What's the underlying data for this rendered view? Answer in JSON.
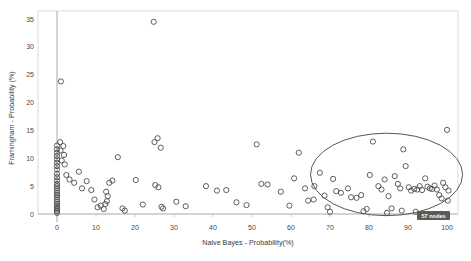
{
  "chart_data": {
    "type": "scatter",
    "title": "",
    "xlabel": "Naive Bayes - Probability(%)",
    "ylabel": "Framingham - Probability (%)",
    "xlim": [
      -4,
      106
    ],
    "ylim": [
      -1.2,
      37
    ],
    "xticks": [
      0,
      10,
      20,
      30,
      40,
      50,
      60,
      70,
      80,
      90,
      100
    ],
    "xtick_labels": [
      "0",
      "10",
      "20",
      "30",
      "40",
      "50",
      "60",
      "70",
      "80",
      "90",
      "100"
    ],
    "yticks": [
      0,
      5,
      10,
      15,
      20,
      25,
      30,
      35
    ],
    "ytick_labels": [
      "0",
      "5",
      "10",
      "15",
      "20",
      "25",
      "30",
      "35"
    ],
    "grid": false,
    "marker": "open-circle",
    "marker_color": "#4d4d4d",
    "marker_radius": 2.6,
    "points": [
      [
        0,
        0.2
      ],
      [
        0,
        0.5
      ],
      [
        0,
        0.8
      ],
      [
        0,
        1.1
      ],
      [
        0,
        1.4
      ],
      [
        0,
        1.8
      ],
      [
        0,
        2.2
      ],
      [
        0,
        2.6
      ],
      [
        0,
        3.0
      ],
      [
        0,
        3.4
      ],
      [
        0,
        3.8
      ],
      [
        0,
        4.2
      ],
      [
        0,
        4.6
      ],
      [
        0,
        5.0
      ],
      [
        0,
        5.4
      ],
      [
        0,
        6.0
      ],
      [
        0,
        6.6
      ],
      [
        0,
        7.2
      ],
      [
        0,
        8.0
      ],
      [
        0,
        8.6
      ],
      [
        0,
        9.2
      ],
      [
        0,
        9.8
      ],
      [
        0,
        10.4
      ],
      [
        0,
        11.0
      ],
      [
        0,
        11.6
      ],
      [
        0,
        12.3
      ],
      [
        0.8,
        12.9
      ],
      [
        1.6,
        12.2
      ],
      [
        0.9,
        11.4
      ],
      [
        1.8,
        10.6
      ],
      [
        1.2,
        9.6
      ],
      [
        2.0,
        8.9
      ],
      [
        1.0,
        23.8
      ],
      [
        2.4,
        7.0
      ],
      [
        3.2,
        6.2
      ],
      [
        4.4,
        5.6
      ],
      [
        5.6,
        7.6
      ],
      [
        6.4,
        4.6
      ],
      [
        7.6,
        5.9
      ],
      [
        8.8,
        4.3
      ],
      [
        9.6,
        2.6
      ],
      [
        10.4,
        1.2
      ],
      [
        11.2,
        1.5
      ],
      [
        12.0,
        0.9
      ],
      [
        12.4,
        1.8
      ],
      [
        12.8,
        2.3
      ],
      [
        13.0,
        3.2
      ],
      [
        12.6,
        4.0
      ],
      [
        13.4,
        5.6
      ],
      [
        14.2,
        6.0
      ],
      [
        15.6,
        10.2
      ],
      [
        16.8,
        1.0
      ],
      [
        17.4,
        0.6
      ],
      [
        20.2,
        6.1
      ],
      [
        22.0,
        1.7
      ],
      [
        24.8,
        34.5
      ],
      [
        25.0,
        12.9
      ],
      [
        25.8,
        13.6
      ],
      [
        26.6,
        11.9
      ],
      [
        25.2,
        5.2
      ],
      [
        26.0,
        4.8
      ],
      [
        26.8,
        1.3
      ],
      [
        27.2,
        1.0
      ],
      [
        30.6,
        2.2
      ],
      [
        33.0,
        1.4
      ],
      [
        38.2,
        5.0
      ],
      [
        41.0,
        4.2
      ],
      [
        43.4,
        4.3
      ],
      [
        46.0,
        2.1
      ],
      [
        48.6,
        1.6
      ],
      [
        51.2,
        12.5
      ],
      [
        52.4,
        5.4
      ],
      [
        54.0,
        5.3
      ],
      [
        57.4,
        4.0
      ],
      [
        59.6,
        1.5
      ],
      [
        62.0,
        11.0
      ],
      [
        63.6,
        4.6
      ],
      [
        64.4,
        2.4
      ],
      [
        65.8,
        2.6
      ],
      [
        67.4,
        7.4
      ],
      [
        68.6,
        3.3
      ],
      [
        69.4,
        1.2
      ],
      [
        70.8,
        6.3
      ],
      [
        71.6,
        4.1
      ],
      [
        72.8,
        3.8
      ],
      [
        74.6,
        4.6
      ],
      [
        75.4,
        3.0
      ],
      [
        76.8,
        2.9
      ],
      [
        78.0,
        3.4
      ],
      [
        79.4,
        0.9
      ],
      [
        80.2,
        7.0
      ],
      [
        81.0,
        13.0
      ],
      [
        82.4,
        5.0
      ],
      [
        83.2,
        4.4
      ],
      [
        84.0,
        6.2
      ],
      [
        85.0,
        3.2
      ],
      [
        85.8,
        1.0
      ],
      [
        86.6,
        6.8
      ],
      [
        87.4,
        5.4
      ],
      [
        88.0,
        4.6
      ],
      [
        88.8,
        11.6
      ],
      [
        89.4,
        8.6
      ],
      [
        90.2,
        4.8
      ],
      [
        90.8,
        4.2
      ],
      [
        91.6,
        4.5
      ],
      [
        92.4,
        4.4
      ],
      [
        93.0,
        5.0
      ],
      [
        93.6,
        4.3
      ],
      [
        94.4,
        6.4
      ],
      [
        95.0,
        4.9
      ],
      [
        95.6,
        4.6
      ],
      [
        96.2,
        4.5
      ],
      [
        96.8,
        5.1
      ],
      [
        97.4,
        4.4
      ],
      [
        98.0,
        3.4
      ],
      [
        98.6,
        2.8
      ],
      [
        99.0,
        5.6
      ],
      [
        99.6,
        4.8
      ],
      [
        100.0,
        15.1
      ],
      [
        100.4,
        4.2
      ],
      [
        100.2,
        2.4
      ],
      [
        88.4,
        0.6
      ],
      [
        92.0,
        0.4
      ],
      [
        78.6,
        0.5
      ],
      [
        70.0,
        0.4
      ],
      [
        84.6,
        0.2
      ],
      [
        60.8,
        6.4
      ],
      [
        66.0,
        5.0
      ]
    ],
    "annotations": [
      {
        "type": "ellipse",
        "name": "highlight-ellipse",
        "cx": 84.5,
        "cy": 7.1,
        "rx": 19.5,
        "ry": 7.4,
        "stroke": "#555555"
      }
    ],
    "badge": {
      "label": "57 nodes",
      "background": "#5a5a5a",
      "text_color": "#ffffff"
    }
  },
  "axes": {
    "frame_color": "#d8d8d8",
    "baseline_color": "#b9b9b9",
    "vertical_line_color": "#a9a9a9"
  }
}
